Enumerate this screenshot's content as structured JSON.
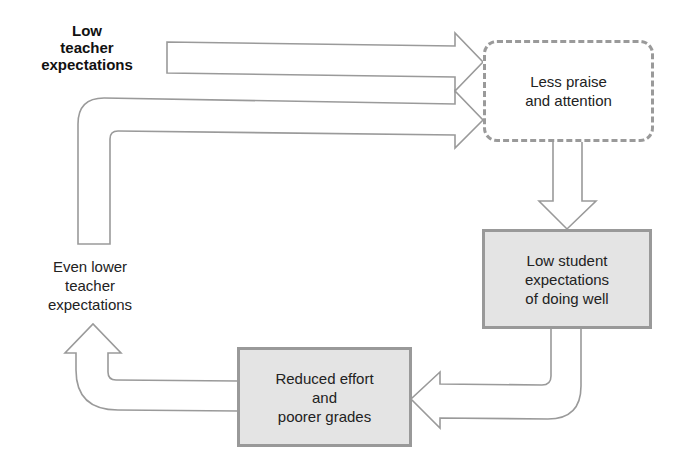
{
  "diagram": {
    "nodes": [
      {
        "id": "low-teacher-expectations",
        "label": "Low\nteacher\nexpectations",
        "style": "bold-text"
      },
      {
        "id": "less-praise",
        "label": "Less praise\nand attention",
        "style": "dashed-rounded-box"
      },
      {
        "id": "low-student-expectations",
        "label": "Low student\nexpectations\nof doing well",
        "style": "shaded-box"
      },
      {
        "id": "reduced-effort",
        "label": "Reduced effort\nand\npoorer grades",
        "style": "shaded-box"
      },
      {
        "id": "even-lower-expectations",
        "label": "Even lower\nteacher\nexpectations",
        "style": "plain-text"
      }
    ],
    "edges": [
      {
        "from": "low-teacher-expectations",
        "to": "less-praise",
        "type": "block-arrow-right"
      },
      {
        "from": "less-praise",
        "to": "low-student-expectations",
        "type": "block-arrow-down"
      },
      {
        "from": "low-student-expectations",
        "to": "reduced-effort",
        "type": "curved-block-arrow-left"
      },
      {
        "from": "reduced-effort",
        "to": "even-lower-expectations",
        "type": "curved-block-arrow-up"
      },
      {
        "from": "even-lower-expectations",
        "to": "less-praise",
        "type": "L-block-arrow-right"
      }
    ],
    "colors": {
      "arrow_stroke": "#9a9a9a",
      "box_fill": "#e4e4e4",
      "box_border": "#999999",
      "text": "#222222"
    }
  }
}
